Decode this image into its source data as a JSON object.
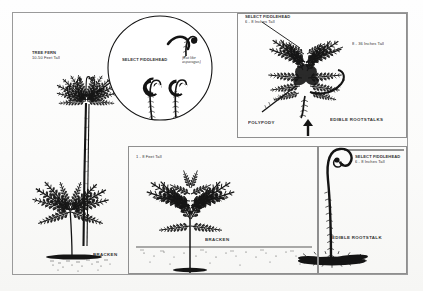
{
  "document": {
    "title": "Edible Ferns Identification Plate",
    "background_color": "#fdfdfc",
    "ink_color": "#1d1d1d",
    "frame_color": "#9a9a9a"
  },
  "panels": {
    "tree_fern": {
      "name_label": "TREE FERN",
      "height_label": "10-50 Feet Tall",
      "bottom_label": "BRACKEN"
    },
    "magnifier_inset": {
      "caption": "SELECT FIDDLEHEAD",
      "note": "(Eat like\nasparagus)"
    },
    "polypody": {
      "caption": "SELECT FIDDLEHEAD",
      "height_label": "6 - 8 Inches Tall",
      "frond_height_label": "8 - 36 Inches Tall",
      "name_label": "POLYPODY",
      "rootstalk_label": "EDIBLE ROOTSTALKS"
    },
    "bracken": {
      "height_label": "1 - 8 Feet Tall",
      "name_label": "BRACKEN"
    },
    "rootstalk": {
      "caption": "SELECT FIDDLEHEAD",
      "height_label": "6 - 8 Inches Tall",
      "name_label": "EDIBLE ROOTSTALK"
    }
  }
}
